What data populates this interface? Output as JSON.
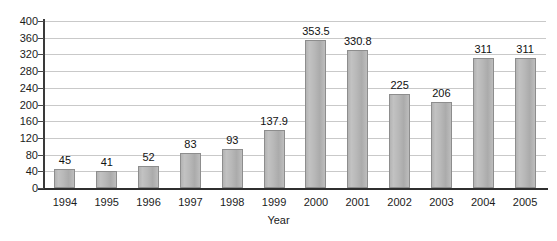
{
  "chart_data": {
    "type": "bar",
    "title": "",
    "xlabel": "Year",
    "ylabel": "",
    "categories": [
      "1994",
      "1995",
      "1996",
      "1997",
      "1998",
      "1999",
      "2000",
      "2001",
      "2002",
      "2003",
      "2004",
      "2005"
    ],
    "values": [
      45,
      41,
      52,
      83,
      93,
      137.9,
      353.5,
      330.8,
      225,
      206,
      311,
      311
    ],
    "value_labels": [
      "45",
      "41",
      "52",
      "83",
      "93",
      "137.9",
      "353.5",
      "330.8",
      "225",
      "206",
      "311",
      "311"
    ],
    "ylim": [
      0,
      400
    ],
    "ytick_step": 40,
    "yticks": [
      0,
      40,
      80,
      120,
      160,
      200,
      240,
      280,
      320,
      360,
      400
    ],
    "ytick_labels": [
      "0",
      "40",
      "80",
      "120",
      "160",
      "200",
      "240",
      "280",
      "320",
      "360",
      "400"
    ],
    "grid": true,
    "grid_axis": "y",
    "legend": false,
    "legend_position": "none",
    "bar_color": "#b8b8b8",
    "bar_border_color": "#8d8d8d",
    "gridline_color": "#c9c9c9",
    "axis_color": "#2f2f2f",
    "text_color": "#1b1b1b",
    "background_color": "#ffffff"
  }
}
